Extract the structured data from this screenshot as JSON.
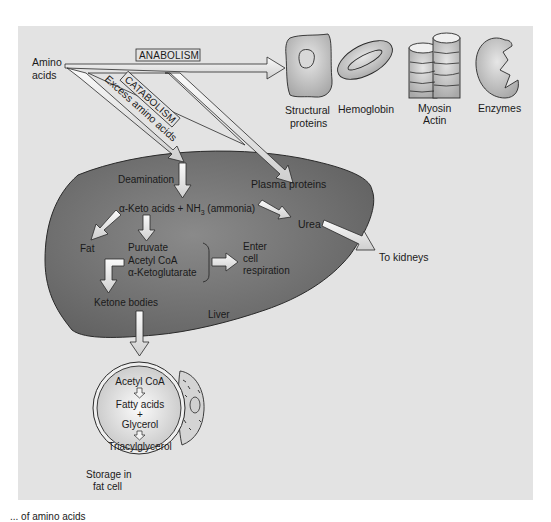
{
  "diagram": {
    "title_fragment": "... of amino acids",
    "colors": {
      "panel_bg": "#e3e3e3",
      "liver_fill": "#6f6f6f",
      "arrow_fill": "#f2f2f2",
      "outline": "#2a2a2a",
      "page_bg": "#ffffff"
    },
    "source": {
      "line1": "Amino",
      "line2": "acids"
    },
    "pathways": {
      "anabolism": "ANABOLISM",
      "catabolism": "CATABOLISM",
      "excess": "Excess amino acids"
    },
    "products": [
      {
        "id": "structural",
        "line1": "Structural",
        "line2": "proteins",
        "icon": "cell-icon"
      },
      {
        "id": "hemoglobin",
        "line1": "Hemoglobin",
        "line2": "",
        "icon": "red-blood-cell-icon"
      },
      {
        "id": "myosin-actin",
        "line1": "Myosin",
        "line2": "Actin",
        "icon": "muscle-fiber-icon"
      },
      {
        "id": "enzymes",
        "line1": "Enzymes",
        "line2": "",
        "icon": "enzyme-icon"
      }
    ],
    "liver": {
      "label": "Liver",
      "deamination": "Deamination",
      "keto_acids_prefix": "α-Keto acids + NH",
      "keto_acids_sub": "3",
      "keto_acids_suffix": " (ammonia)",
      "plasma_proteins": "Plasma proteins",
      "urea": "Urea",
      "fat": "Fat",
      "intermediates": [
        "Puruvate",
        "Acetyl CoA",
        "α-Ketoglutarate"
      ],
      "respiration": [
        "Enter",
        "cell",
        "respiration"
      ],
      "ketone_bodies": "Ketone bodies"
    },
    "kidneys": "To kidneys",
    "fat_cell": {
      "steps": [
        "Acetyl CoA",
        "Fatty acids",
        "+",
        "Glycerol",
        "Triacylglycerol"
      ],
      "caption_line1": "Storage in",
      "caption_line2": "fat cell"
    }
  }
}
